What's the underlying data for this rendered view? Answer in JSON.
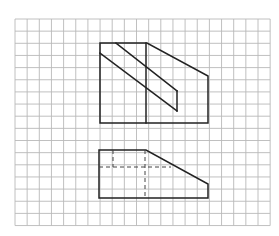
{
  "diagram": {
    "type": "orthographic-projection-on-grid",
    "colors": {
      "background": "#ffffff",
      "grid": "#b9b9b9",
      "edge": "#222222",
      "hidden_edge": "#444444"
    },
    "grid": {
      "left": 15,
      "top": 19,
      "cell": 12.15,
      "columns": 21,
      "rows": 17
    },
    "front_view": {
      "outline": [
        [
          100,
          43
        ],
        [
          147,
          43
        ],
        [
          208,
          76
        ],
        [
          208,
          123
        ],
        [
          100,
          123
        ]
      ],
      "vertical_edge": [
        [
          146,
          43
        ],
        [
          146,
          123
        ]
      ],
      "slot_upper_line": [
        [
          116,
          43
        ],
        [
          177,
          91
        ]
      ],
      "slot_lower_line": [
        [
          100,
          53
        ],
        [
          177,
          111
        ]
      ],
      "slot_end_line": [
        [
          177,
          91
        ],
        [
          177,
          111
        ]
      ]
    },
    "top_view": {
      "outline": [
        [
          99,
          150
        ],
        [
          146,
          150
        ],
        [
          208,
          184
        ],
        [
          208,
          198
        ],
        [
          99,
          198
        ]
      ],
      "hidden_horizontal": [
        [
          99,
          167
        ],
        [
          171,
          167
        ]
      ],
      "hidden_vertical_left": [
        [
          113,
          150
        ],
        [
          113,
          167
        ]
      ],
      "hidden_vertical_right": [
        [
          145,
          150
        ],
        [
          145,
          198
        ]
      ]
    }
  }
}
